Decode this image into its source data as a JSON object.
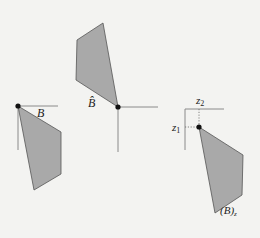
{
  "figure": {
    "panels": [
      {
        "id": "original",
        "label": "B",
        "origin": [
          18,
          106
        ],
        "polygon": [
          [
            18,
            106
          ],
          [
            61,
            132
          ],
          [
            61,
            174
          ],
          [
            34,
            190
          ]
        ]
      },
      {
        "id": "reflection",
        "label": "B̂",
        "origin": [
          118,
          107
        ],
        "polygon": [
          [
            118,
            107
          ],
          [
            103,
            23
          ],
          [
            77,
            40
          ],
          [
            76,
            80
          ]
        ]
      },
      {
        "id": "translation",
        "label": "(B)",
        "label_sub": "z",
        "origin": [
          185,
          109
        ],
        "point": [
          199,
          127
        ],
        "axis_labels": {
          "z1": "z",
          "z1_sub": "1",
          "z2": "z",
          "z2_sub": "2"
        },
        "polygon": [
          [
            199,
            127
          ],
          [
            243,
            155
          ],
          [
            242,
            195
          ],
          [
            215,
            213
          ]
        ]
      }
    ],
    "colors": {
      "fill": "#a9a9a9",
      "stroke": "#555555",
      "axis": "#8a8a8a",
      "dot": "#111111",
      "background": "#f3f3f1"
    }
  }
}
